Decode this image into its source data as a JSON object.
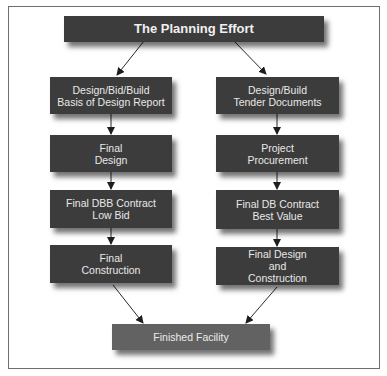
{
  "diagram": {
    "title": "The Planning Effort",
    "left_column": {
      "steps": [
        {
          "label": "Design/Bid/Build\nBasis of Design Report"
        },
        {
          "label": "Final\nDesign"
        },
        {
          "label": "Final DBB Contract\nLow Bid"
        },
        {
          "label": "Final\nConstruction"
        }
      ]
    },
    "right_column": {
      "steps": [
        {
          "label": "Design/Build\nTender Documents"
        },
        {
          "label": "Project\nProcurement"
        },
        {
          "label": "Final DB Contract\nBest Value"
        },
        {
          "label": "Final Design\nand\nConstruction"
        }
      ]
    },
    "result": "Finished Facility",
    "colors": {
      "box": "#3c3c3c",
      "result_box": "#626262",
      "text": "#e8e8e8",
      "arrow": "#2a2a2a",
      "frame": "#6e6e6e"
    }
  }
}
